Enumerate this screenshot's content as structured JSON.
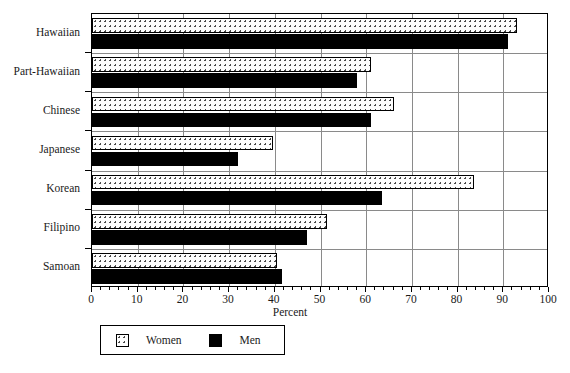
{
  "chart_data": {
    "type": "bar",
    "orientation": "horizontal",
    "title": "",
    "xlabel": "Percent",
    "ylabel": "",
    "xlim": [
      0,
      100
    ],
    "xticks": [
      0,
      10,
      20,
      30,
      40,
      50,
      60,
      70,
      80,
      90,
      100
    ],
    "xtick_labels": [
      "0",
      "10",
      "20",
      "30",
      "40",
      "50",
      "60",
      "70",
      "80",
      "90",
      "100"
    ],
    "minor_tick_interval": 2,
    "grid": "vertical-major",
    "legend_position": "below-left",
    "categories": [
      "Hawaiian",
      "Part-Hawaiian",
      "Chinese",
      "Japanese",
      "Korean",
      "Filipino",
      "Samoan"
    ],
    "series": [
      {
        "name": "Women",
        "fill": "dotted",
        "values": [
          93,
          61,
          66,
          39.5,
          83.5,
          51.5,
          40.5
        ]
      },
      {
        "name": "Men",
        "fill": "solid-black",
        "values": [
          91,
          58,
          61,
          32,
          63.5,
          47,
          41.5
        ]
      }
    ]
  },
  "axis": {
    "x_title": "Percent"
  },
  "legend": {
    "items": [
      {
        "label": "Women",
        "swatch": "dotted-swatch"
      },
      {
        "label": "Men",
        "swatch": "black-swatch"
      }
    ]
  },
  "colors": {
    "men_fill": "#000000",
    "women_fill": "#fdfdfd",
    "women_dot": "#4a4a4a",
    "frame": "#000000",
    "gridline": "#8a8a8a",
    "text": "#1a1a1a",
    "background": "#ffffff"
  }
}
